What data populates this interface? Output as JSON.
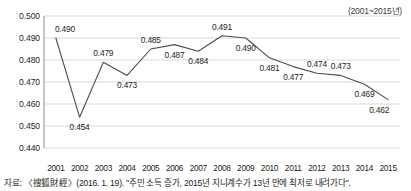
{
  "period_note": "(2001~2015년)",
  "source_note": "자료: 〈搜狐財經〉(2016. 1. 19). \"주민 소득 증가, 2015년 지니계수가 13년 만에 최저로 내려가다\".",
  "colors": {
    "line": "#4d4d4f",
    "gridline": "#d9d9d9",
    "axis": "#8c8c8c",
    "text": "#231f20",
    "background": "#ffffff"
  },
  "chart_data": {
    "type": "line",
    "title": "",
    "xlabel": "",
    "ylabel": "",
    "categories": [
      "2001",
      "2002",
      "2003",
      "2004",
      "2005",
      "2006",
      "2007",
      "2008",
      "2009",
      "2010",
      "2011",
      "2012",
      "2013",
      "2014",
      "2015"
    ],
    "values": [
      0.49,
      0.454,
      0.479,
      0.473,
      0.485,
      0.487,
      0.484,
      0.491,
      0.49,
      0.481,
      0.477,
      0.474,
      0.473,
      0.469,
      0.462
    ],
    "point_labels": [
      "0.490",
      "0.454",
      "0.479",
      "0.473",
      "0.485",
      "0.487",
      "0.484",
      "0.491",
      "0.490",
      "0.481",
      "0.477",
      "0.474",
      "0.473",
      "0.469",
      "0.462"
    ],
    "label_positions": [
      "above",
      "below",
      "above",
      "below",
      "above",
      "below",
      "below",
      "above",
      "below",
      "below",
      "below",
      "above",
      "above",
      "below",
      "below"
    ],
    "ylim": [
      0.44,
      0.5
    ],
    "ytick_labels": [
      "0.500",
      "0.490",
      "0.480",
      "0.470",
      "0.460",
      "0.450",
      "0.440"
    ],
    "ytick_values": [
      0.5,
      0.49,
      0.48,
      0.47,
      0.46,
      0.45,
      0.44
    ],
    "grid": true,
    "legend": "none",
    "series_name": "지니계수"
  }
}
